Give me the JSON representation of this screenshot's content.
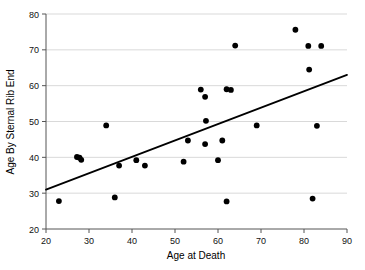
{
  "chart_data": {
    "type": "scatter",
    "title": "",
    "xlabel": "Age at Death",
    "ylabel": "Age By Sternal Rib End",
    "xlim": [
      20,
      90
    ],
    "ylim": [
      20,
      80
    ],
    "xticks": [
      20,
      30,
      40,
      50,
      60,
      70,
      80,
      90
    ],
    "xtick_labels": [
      "20",
      "30",
      "40",
      "50",
      "60",
      "70",
      "80",
      "90"
    ],
    "yticks": [
      20,
      30,
      40,
      50,
      60,
      70,
      80
    ],
    "ytick_labels": [
      "20",
      "30",
      "40",
      "50",
      "60",
      "70",
      "80"
    ],
    "grid": "horizontal",
    "legend": "none",
    "point_color": "#000000",
    "line_color": "#000000",
    "grid_color": "#c8c8c8",
    "points": [
      {
        "x": 23.0,
        "y": 27.8
      },
      {
        "x": 27.2,
        "y": 40.1
      },
      {
        "x": 27.8,
        "y": 39.9
      },
      {
        "x": 28.2,
        "y": 39.3
      },
      {
        "x": 34.0,
        "y": 48.9
      },
      {
        "x": 36.0,
        "y": 28.8
      },
      {
        "x": 37.0,
        "y": 37.7
      },
      {
        "x": 41.0,
        "y": 39.2
      },
      {
        "x": 43.0,
        "y": 37.7
      },
      {
        "x": 52.0,
        "y": 38.8
      },
      {
        "x": 53.0,
        "y": 44.7
      },
      {
        "x": 56.0,
        "y": 58.9
      },
      {
        "x": 57.0,
        "y": 56.9
      },
      {
        "x": 57.2,
        "y": 50.2
      },
      {
        "x": 57.0,
        "y": 43.7
      },
      {
        "x": 60.0,
        "y": 39.2
      },
      {
        "x": 61.0,
        "y": 44.7
      },
      {
        "x": 62.0,
        "y": 59.0
      },
      {
        "x": 63.0,
        "y": 58.8
      },
      {
        "x": 62.0,
        "y": 27.7
      },
      {
        "x": 64.0,
        "y": 71.2
      },
      {
        "x": 69.0,
        "y": 48.9
      },
      {
        "x": 78.0,
        "y": 75.6
      },
      {
        "x": 81.0,
        "y": 71.1
      },
      {
        "x": 81.2,
        "y": 64.5
      },
      {
        "x": 82.0,
        "y": 28.5
      },
      {
        "x": 83.0,
        "y": 48.8
      },
      {
        "x": 84.0,
        "y": 71.1
      }
    ],
    "fit_line": {
      "type": "linear",
      "x_start": 20,
      "y_start": 31.0,
      "x_end": 90,
      "y_end": 63.0
    }
  }
}
